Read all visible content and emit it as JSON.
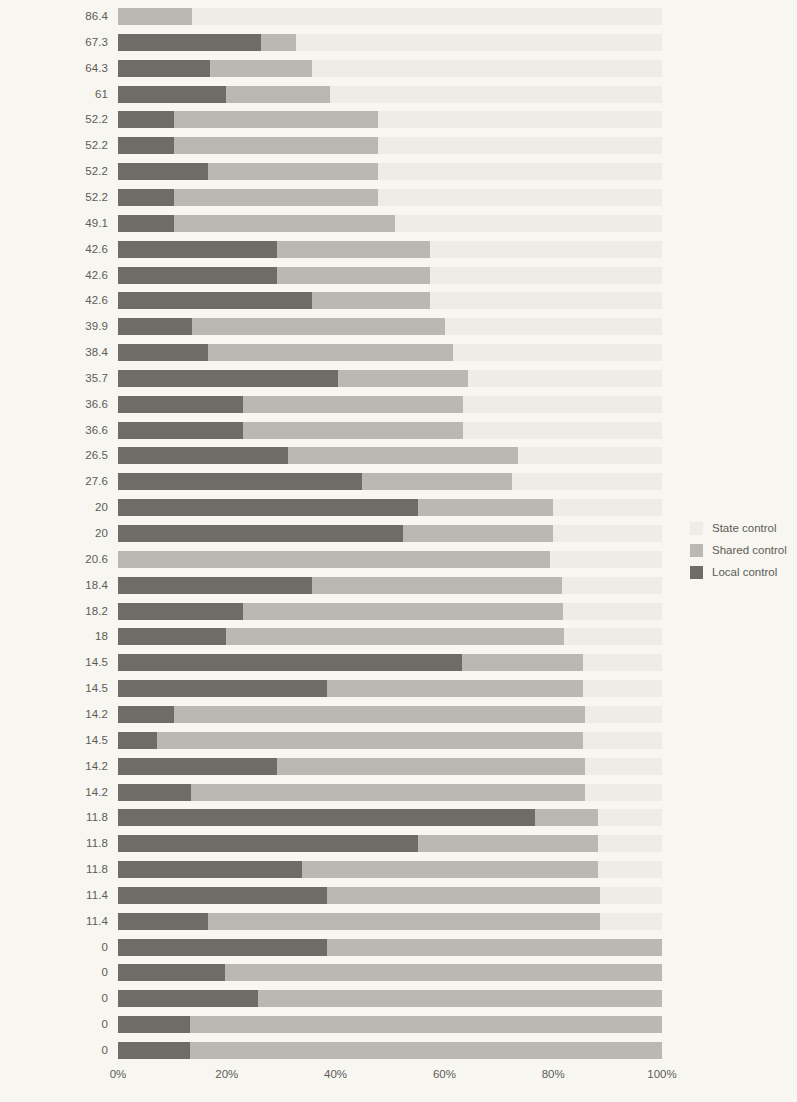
{
  "chart_data": {
    "type": "bar",
    "subtype": "horizontal stacked bar (100% stacked)",
    "title": "",
    "subtitle": "",
    "xlabel": "",
    "ylabel": "",
    "xlim": [
      0,
      100
    ],
    "xtick_labels": [
      "0%",
      "20%",
      "40%",
      "60%",
      "80%",
      "100%"
    ],
    "xtick_values": [
      0,
      20,
      40,
      60,
      80,
      100
    ],
    "grid": false,
    "legend_position": "right",
    "series": [
      {
        "name": "Local control",
        "color": "#6e6c66"
      },
      {
        "name": "Shared control",
        "color": "#bab9b1"
      },
      {
        "name": "State control",
        "color": "#eeece5"
      }
    ],
    "legend_entries": [
      {
        "label": "State control",
        "color": "#eeece5"
      },
      {
        "label": "Shared control",
        "color": "#bab9b1"
      },
      {
        "label": "Local control",
        "color": "#6e6c66"
      }
    ],
    "categories": [
      "Connecticut",
      "Vermont",
      "Rhode Island",
      "Alabama",
      "West Virginia",
      "Utah",
      "Arkansas",
      "Massachusetts",
      "Colorado",
      "North Dakota",
      "North Carolina",
      "Minnesota",
      "Kentucky",
      "Iowa",
      "Michigan",
      "Wisconsin",
      "Alaska",
      "Georgia",
      "New Hampshire",
      "Pennsylvania",
      "Louisiana",
      "New Jersey",
      "Mississippi",
      "Kansas",
      "Oregon",
      "South Carolina",
      "Washington",
      "South Dakota",
      "Illinois",
      "California",
      "Arizona",
      "Texas",
      "Nevada",
      "Florida",
      "Ohio",
      "Delaware",
      "Missouri",
      "Indiana",
      "Tennessee",
      "New Mexico",
      "Maryland"
    ],
    "rows": [
      {
        "state": 86.4,
        "local": 0.0,
        "shared": 13.6
      },
      {
        "state": 67.3,
        "local": 26.3,
        "shared": 6.4
      },
      {
        "state": 64.3,
        "local": 16.9,
        "shared": 18.8
      },
      {
        "state": 61.0,
        "local": 19.8,
        "shared": 19.2
      },
      {
        "state": 52.2,
        "local": 10.3,
        "shared": 37.5
      },
      {
        "state": 52.2,
        "local": 10.3,
        "shared": 37.5
      },
      {
        "state": 52.2,
        "local": 16.5,
        "shared": 31.3
      },
      {
        "state": 52.2,
        "local": 10.3,
        "shared": 37.5
      },
      {
        "state": 49.1,
        "local": 10.3,
        "shared": 40.6
      },
      {
        "state": 42.6,
        "local": 29.2,
        "shared": 28.2
      },
      {
        "state": 42.6,
        "local": 29.2,
        "shared": 28.2
      },
      {
        "state": 42.6,
        "local": 35.7,
        "shared": 21.7
      },
      {
        "state": 39.9,
        "local": 13.6,
        "shared": 46.5
      },
      {
        "state": 38.4,
        "local": 16.5,
        "shared": 45.1
      },
      {
        "state": 35.7,
        "local": 40.4,
        "shared": 23.9
      },
      {
        "state": 36.6,
        "local": 23.0,
        "shared": 40.4
      },
      {
        "state": 36.6,
        "local": 23.0,
        "shared": 40.4
      },
      {
        "state": 26.5,
        "local": 31.3,
        "shared": 42.2
      },
      {
        "state": 27.6,
        "local": 44.9,
        "shared": 27.5
      },
      {
        "state": 20.0,
        "local": 55.1,
        "shared": 24.9
      },
      {
        "state": 20.0,
        "local": 52.4,
        "shared": 27.6
      },
      {
        "state": 20.6,
        "local": 0.0,
        "shared": 79.4
      },
      {
        "state": 18.4,
        "local": 35.7,
        "shared": 45.9
      },
      {
        "state": 18.2,
        "local": 23.0,
        "shared": 58.8
      },
      {
        "state": 18.0,
        "local": 19.8,
        "shared": 62.2
      },
      {
        "state": 14.5,
        "local": 63.2,
        "shared": 22.3
      },
      {
        "state": 14.5,
        "local": 38.4,
        "shared": 47.1
      },
      {
        "state": 14.2,
        "local": 10.3,
        "shared": 75.5
      },
      {
        "state": 14.5,
        "local": 7.2,
        "shared": 78.3
      },
      {
        "state": 14.2,
        "local": 29.2,
        "shared": 56.6
      },
      {
        "state": 14.2,
        "local": 13.4,
        "shared": 72.4
      },
      {
        "state": 11.8,
        "local": 76.7,
        "shared": 11.5
      },
      {
        "state": 11.8,
        "local": 55.1,
        "shared": 33.1
      },
      {
        "state": 11.8,
        "local": 33.8,
        "shared": 54.4
      },
      {
        "state": 11.4,
        "local": 38.4,
        "shared": 50.2
      },
      {
        "state": 11.4,
        "local": 16.5,
        "shared": 72.1
      },
      {
        "state": 0.0,
        "local": 38.4,
        "shared": 61.6
      },
      {
        "state": 0.0,
        "local": 19.7,
        "shared": 80.3
      },
      {
        "state": 0.0,
        "local": 25.7,
        "shared": 74.3
      },
      {
        "state": 0.0,
        "local": 13.2,
        "shared": 86.8
      },
      {
        "state": 0.0,
        "local": 13.2,
        "shared": 86.8
      }
    ]
  },
  "colors": {
    "background": "#f7f6f1",
    "local": "#6e6c66",
    "shared": "#bab9b1",
    "state": "#eeece5",
    "text": "#5d5c57"
  }
}
